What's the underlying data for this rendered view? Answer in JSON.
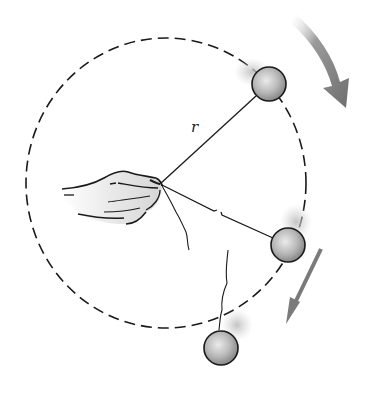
{
  "diagram": {
    "labels": {
      "radius": "r"
    },
    "elements": {
      "circle_path": "dashed circular path of radius r",
      "hand": "hand holding center end of string",
      "ball_top": "ball on string at upper right of circle",
      "ball_right": "ball on string at right of circle (string about to break)",
      "ball_released": "ball flying off tangentially after string breaks",
      "arrow_rotation": "curved arrow showing clockwise motion",
      "arrow_tangent": "straight arrow showing tangential direction after release"
    },
    "colors": {
      "line": "#1a1a1a",
      "ball_fill": "#b0b0b0",
      "ball_highlight": "#e6e6e6",
      "arrow": "#7a7a7a",
      "blur": "#c8c8c8",
      "background": "#ffffff"
    }
  }
}
